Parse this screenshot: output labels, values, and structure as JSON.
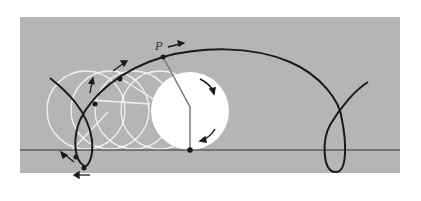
{
  "diagram": {
    "type": "rolling-circle-trochoid",
    "labels": {
      "point": "P"
    },
    "colors": {
      "background": "#ffffff",
      "panel": "#b5b5b5",
      "curve": "#1a1a1a",
      "ghost_circles": "#f2f2f2",
      "main_circle": "#ffffff",
      "spoke": "#7a7a7a",
      "baseline": "#333333"
    }
  }
}
